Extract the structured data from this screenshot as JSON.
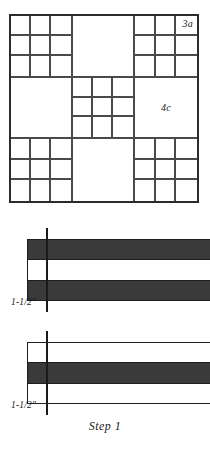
{
  "figure": {
    "caption": "Step  1",
    "block": {
      "name": "quilt-block-diagram",
      "labels": [
        {
          "id": "3a",
          "text": "3a",
          "position": "top-right-unit"
        },
        {
          "id": "4c",
          "text": "4c",
          "position": "middle-right-unit"
        }
      ],
      "grid": {
        "rows": 3,
        "cols": 3,
        "units": [
          "nine-patch",
          "plain",
          "nine-patch",
          "plain",
          "nine-patch",
          "plain",
          "nine-patch",
          "plain",
          "nine-patch"
        ]
      }
    },
    "strip_sets": [
      {
        "id": "strip-set-1",
        "strips": [
          "dark",
          "light",
          "dark"
        ],
        "dimension_label": "1-1/2\"",
        "guide": "vertical-cut-line"
      },
      {
        "id": "strip-set-2",
        "strips": [
          "light",
          "dark",
          "light"
        ],
        "dimension_label": "1-1/2\"",
        "guide": "vertical-cut-line"
      }
    ]
  },
  "colors": {
    "dark_fabric": "#3a3a3a",
    "light_fabric": "#ffffff",
    "outline": "#1f1f1f",
    "grid_line": "#4a4a4a"
  }
}
